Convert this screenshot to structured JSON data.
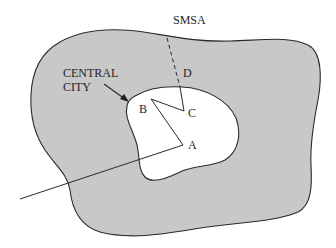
{
  "diagram": {
    "labels": {
      "smsa": "SMSA",
      "central_line1": "CENTRAL",
      "central_line2": "CITY",
      "point_a": "A",
      "point_b": "B",
      "point_c": "C",
      "point_d": "D"
    },
    "colors": {
      "smsa_fill": "#c8c8c8",
      "central_city_fill": "#ffffff",
      "stroke": "#2a2a2a"
    },
    "regions": [
      {
        "name": "SMSA",
        "fill": "gray"
      },
      {
        "name": "CENTRAL CITY",
        "fill": "white"
      }
    ],
    "paths": [
      {
        "name": "route-D-to-C",
        "style": "dashed-then-solid",
        "points": [
          "D",
          "C"
        ]
      },
      {
        "name": "route-C-B-A",
        "style": "solid",
        "points": [
          "C",
          "B",
          "A"
        ]
      },
      {
        "name": "route-A-outbound",
        "style": "solid",
        "points": [
          "A",
          "outside"
        ]
      }
    ]
  }
}
